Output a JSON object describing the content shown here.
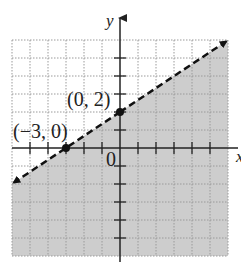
{
  "graph": {
    "type": "linear-inequality",
    "inequality": "y < (2/3)x + 2",
    "boundary_style": "dashed",
    "shaded_region": "below",
    "x_range": [
      -6,
      6
    ],
    "y_range": [
      -6,
      6
    ],
    "axis_labels": {
      "x": "x",
      "y": "y"
    },
    "origin_label": "0",
    "points": [
      {
        "label": "(0, 2)",
        "x": 0,
        "y": 2
      },
      {
        "label": "(−3, 0)",
        "x": -3,
        "y": 0
      }
    ],
    "colors": {
      "shade": "#c9c9c9",
      "grid": "#9a9a9a",
      "axis": "#222222",
      "line": "#111111"
    }
  }
}
